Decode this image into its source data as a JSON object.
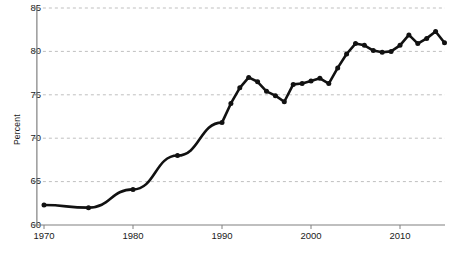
{
  "chart_data": {
    "type": "line",
    "title": "",
    "subtitle": "",
    "xlabel": "",
    "ylabel": "Percent",
    "xlim": [
      1969,
      1916
    ],
    "x_range": [
      1969,
      2016
    ],
    "ylim": [
      60,
      85
    ],
    "y_ticks": [
      60,
      65,
      70,
      75,
      80,
      85
    ],
    "x_ticks": [
      1970,
      1980,
      1990,
      2000,
      2010
    ],
    "grid": "horizontal-dashed",
    "legend": "none",
    "marker": "filled-circle",
    "line_color": "#111111",
    "grid_color": "#b8b8b8",
    "axis_color": "#808080",
    "x": [
      1970,
      1975,
      1980,
      1985,
      1990,
      1991,
      1992,
      1993,
      1994,
      1995,
      1996,
      1997,
      1998,
      1999,
      2000,
      2001,
      2002,
      2003,
      2004,
      2005,
      2006,
      2007,
      2008,
      2009,
      2010,
      2011,
      2012,
      2013,
      2014,
      2015
    ],
    "values": [
      62.3,
      62.0,
      64.1,
      68.0,
      71.8,
      74.0,
      75.8,
      77.0,
      76.5,
      75.4,
      74.9,
      74.2,
      76.2,
      76.3,
      76.6,
      76.9,
      76.3,
      78.1,
      79.7,
      80.9,
      80.7,
      80.1,
      79.9,
      80.0,
      80.7,
      81.9,
      80.9,
      81.5,
      82.3,
      81.0
    ],
    "annotations": []
  },
  "ytick_labels": [
    "85",
    "80",
    "75",
    "70",
    "65",
    "60"
  ],
  "xtick_labels": [
    "1970",
    "1980",
    "1990",
    "2000",
    "2010"
  ]
}
